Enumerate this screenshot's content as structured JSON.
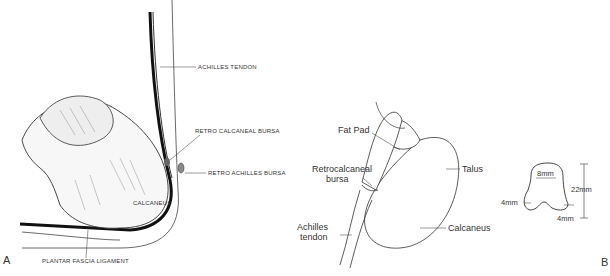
{
  "figure": {
    "panel_a": {
      "letter": "A",
      "labels": {
        "achilles_tendon": "ACHILLES TENDON",
        "retro_calcaneal_bursa": "RETRO CALCANEAL BURSA",
        "retro_achilles_bursa": "RETRO ACHILLES BURSA",
        "calcaneus": "CALCANEUS",
        "plantar_fascia": "PLANTAR FASCIA LIGAMENT"
      }
    },
    "panel_b": {
      "letter": "B",
      "labels": {
        "fat_pad": "Fat Pad",
        "retrocalcaneal_line1": "Retrocalcaneal",
        "retrocalcaneal_line2": "bursa",
        "talus": "Talus",
        "achilles_line1": "Achilles",
        "achilles_line2": "tendon",
        "calcaneus": "Calcaneus"
      },
      "dimensions": {
        "width_top": "8mm",
        "height": "22mm",
        "left_base": "4mm",
        "right_base": "4mm"
      }
    }
  }
}
